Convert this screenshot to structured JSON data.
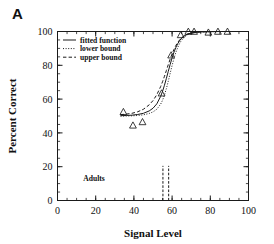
{
  "figure": {
    "panel_label": "A",
    "group_label": "Adults"
  },
  "chart_data": {
    "type": "line",
    "title": "",
    "xlabel": "Signal Level",
    "ylabel": "Percent Correct",
    "xlim": [
      0,
      100
    ],
    "ylim": [
      0,
      100
    ],
    "xticks": [
      0,
      20,
      40,
      60,
      80,
      100
    ],
    "yticks": [
      0,
      20,
      40,
      60,
      80,
      100
    ],
    "xtick_labels": [
      "0",
      "20",
      "40",
      "60",
      "80",
      "100"
    ],
    "ytick_labels": [
      "0",
      "20",
      "40",
      "60",
      "80",
      "100"
    ],
    "xminor_step": 5,
    "yminor_step": 5,
    "grid": false,
    "legend_position": "upper left",
    "legend": [
      {
        "name": "fitted function",
        "style": "solid"
      },
      {
        "name": "lower bound",
        "style": "dotted"
      },
      {
        "name": "upper bound",
        "style": "dashed"
      }
    ],
    "series": [
      {
        "name": "fitted function",
        "style": "solid",
        "x": [
          33,
          36,
          39,
          42,
          45,
          48,
          50,
          52,
          54,
          55,
          56,
          57,
          58,
          59,
          60,
          61,
          62,
          63,
          64,
          65,
          66,
          68,
          70,
          73,
          76,
          80,
          85,
          90
        ],
        "y": [
          50.2,
          50.3,
          50.5,
          50.9,
          51.6,
          53.0,
          54.6,
          57.2,
          61.6,
          64.6,
          68.2,
          72.2,
          76.4,
          80.6,
          84.4,
          87.8,
          90.6,
          92.9,
          94.7,
          96.1,
          97.1,
          98.4,
          99.1,
          99.6,
          99.8,
          99.9,
          100.0,
          100.0
        ]
      },
      {
        "name": "lower bound",
        "style": "dotted",
        "x": [
          33,
          36,
          39,
          42,
          45,
          48,
          50,
          52,
          54,
          55,
          56,
          57,
          58,
          59,
          60,
          61,
          62,
          63,
          64,
          65,
          66,
          68,
          70,
          73,
          76,
          80,
          85,
          90
        ],
        "y": [
          49.9,
          50.0,
          50.1,
          50.3,
          50.7,
          51.5,
          52.4,
          54.0,
          57.0,
          59.3,
          62.4,
          66.2,
          70.6,
          75.3,
          79.9,
          84.1,
          87.7,
          90.7,
          93.1,
          94.9,
          96.3,
          98.1,
          99.0,
          99.6,
          99.8,
          99.9,
          100.0,
          100.0
        ]
      },
      {
        "name": "upper bound",
        "style": "dashed",
        "x": [
          33,
          36,
          39,
          42,
          45,
          48,
          50,
          52,
          54,
          55,
          56,
          57,
          58,
          59,
          60,
          61,
          62,
          63,
          64,
          65,
          66,
          68,
          70,
          73,
          76,
          80,
          85,
          90
        ],
        "y": [
          50.8,
          51.1,
          51.6,
          52.5,
          54.0,
          56.6,
          59.1,
          62.6,
          67.4,
          70.3,
          73.5,
          76.9,
          80.4,
          83.7,
          86.8,
          89.5,
          91.8,
          93.6,
          95.1,
          96.3,
          97.2,
          98.4,
          99.1,
          99.6,
          99.8,
          99.9,
          100.0,
          100.0
        ]
      }
    ],
    "points": {
      "name": "observed data",
      "marker": "triangle-up",
      "x": [
        34.5,
        39.5,
        44.5,
        54.5,
        59.5,
        64.5,
        68.5,
        71.5,
        79.0,
        84.0,
        89.0
      ],
      "y": [
        52.5,
        44.5,
        46.5,
        63.5,
        86.0,
        98.0,
        100.0,
        100.0,
        99.5,
        100.0,
        100.0
      ]
    },
    "vertical_markers": {
      "style": "dash-dot",
      "x": [
        55.2,
        58.2
      ],
      "y_top": 20.5,
      "y_bottom": 0
    }
  }
}
